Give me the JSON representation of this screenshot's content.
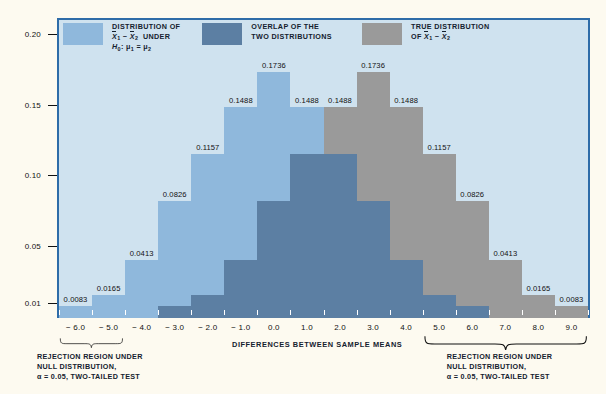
{
  "colors": {
    "page_background": "#fdfaf0",
    "plot_background": "#cfe2ef",
    "plot_border": "#2e6ca8",
    "null_distribution": "#8fb8dc",
    "overlap": "#5c7fa3",
    "true_distribution": "#9a9a9a",
    "text": "#14212e",
    "axis": "#111111",
    "xtick": "#ffffff"
  },
  "legend": {
    "items": [
      {
        "swatch_color": "#8fb8dc",
        "swatch_name": "null-distribution-swatch",
        "lines": [
          "DISTRIBUTION OF",
          "X̄1 − X̄2  UNDER",
          "H0: μ1 = μ2"
        ],
        "line1": "DISTRIBUTION OF",
        "line2_prefix": "X",
        "line2_sub1": "1",
        "line2_minus": " − ",
        "line2_sub2": "2",
        "line2_suffix": "UNDER",
        "line3_h": "H",
        "line3_hsub": "0",
        "line3_rest": ": μ",
        "line3_sub1": "1",
        "line3_eq": " = μ",
        "line3_sub2": "2"
      },
      {
        "swatch_color": "#5c7fa3",
        "swatch_name": "overlap-swatch",
        "line1": "OVERLAP OF THE",
        "line2": "TWO DISTRIBUTIONS"
      },
      {
        "swatch_color": "#9a9a9a",
        "swatch_name": "true-distribution-swatch",
        "line1": "TRUE DISTRIBUTION",
        "line2_prefix": "OF ",
        "line2_x": "X",
        "line2_sub1": "1",
        "line2_minus": " − ",
        "line2_sub2": "2"
      }
    ]
  },
  "axis_title": "DIFFERENCES BETWEEN SAMPLE MEANS",
  "captions": {
    "left": {
      "line1": "REJECTION REGION UNDER",
      "line2": "NULL DISTRIBUTION,",
      "line3": "α = 0.05, TWO-TAILED TEST"
    },
    "right": {
      "line1": "REJECTION REGION UNDER",
      "line2": "NULL DISTRIBUTION,",
      "line3": "α = 0.05, TWO-TAILED TEST"
    }
  },
  "chart_data": {
    "type": "bar",
    "title": "",
    "xlabel": "DIFFERENCES BETWEEN SAMPLE MEANS",
    "ylabel": "",
    "grid": false,
    "legend_position": "top-inside",
    "x": [
      -6.0,
      -5.0,
      -4.0,
      -3.0,
      -2.0,
      -1.0,
      0.0,
      1.0,
      2.0,
      3.0,
      4.0,
      5.0,
      6.0,
      7.0,
      8.0,
      9.0
    ],
    "xtick_labels": [
      "− 6.0",
      "− 5.0",
      "− 4.0",
      "− 3.0",
      "− 2.0",
      "− 1.0",
      "0.0",
      "1.0",
      "2.0",
      "3.0",
      "4.0",
      "5.0",
      "6.0",
      "7.0",
      "8.0",
      "9.0"
    ],
    "ytick_values": [
      0.01,
      0.05,
      0.1,
      0.15,
      0.2
    ],
    "ytick_labels": [
      "0.01",
      "0.05",
      "0.10",
      "0.15",
      "0.20"
    ],
    "ylim": [
      0,
      0.2105
    ],
    "xlim": [
      -6.5,
      9.5
    ],
    "bin_width": 1.0,
    "series": [
      {
        "name": "DISTRIBUTION OF X̄1 − X̄2 UNDER H0: μ1 = μ2",
        "color": "#8fb8dc",
        "center": 0.0,
        "x": [
          -6.0,
          -5.0,
          -4.0,
          -3.0,
          -2.0,
          -1.0,
          0.0,
          1.0,
          2.0,
          3.0,
          4.0,
          5.0,
          6.0
        ],
        "values": [
          0.0083,
          0.0165,
          0.0413,
          0.0826,
          0.1157,
          0.1488,
          0.1736,
          0.1488,
          0.1157,
          0.0826,
          0.0413,
          0.0165,
          0.0083
        ]
      },
      {
        "name": "TRUE DISTRIBUTION OF X̄1 − X̄2",
        "color": "#9a9a9a",
        "center": 3.0,
        "x": [
          -3.0,
          -2.0,
          -1.0,
          0.0,
          1.0,
          2.0,
          3.0,
          4.0,
          5.0,
          6.0,
          7.0,
          8.0,
          9.0
        ],
        "values": [
          0.0083,
          0.0165,
          0.0413,
          0.0826,
          0.1157,
          0.1488,
          0.1736,
          0.1488,
          0.1157,
          0.0826,
          0.0413,
          0.0165,
          0.0083
        ]
      }
    ],
    "labels_left": [
      {
        "x": -6.0,
        "text": "0.0083"
      },
      {
        "x": -5.0,
        "text": "0.0165"
      },
      {
        "x": -4.0,
        "text": "0.0413"
      },
      {
        "x": -3.0,
        "text": "0.0826"
      },
      {
        "x": -2.0,
        "text": "0.1157"
      },
      {
        "x": -1.0,
        "text": "0.1488"
      },
      {
        "x": 0.0,
        "text": "0.1736"
      },
      {
        "x": 1.0,
        "text": "0.1488"
      },
      {
        "x": 2.0,
        "text": "0.1488"
      }
    ],
    "labels_right": [
      {
        "x": 3.0,
        "text": "0.1736"
      },
      {
        "x": 4.0,
        "text": "0.1488"
      },
      {
        "x": 5.0,
        "text": "0.1157"
      },
      {
        "x": 6.0,
        "text": "0.0826"
      },
      {
        "x": 7.0,
        "text": "0.0413"
      },
      {
        "x": 8.0,
        "text": "0.0165"
      },
      {
        "x": 9.0,
        "text": "0.0083"
      }
    ],
    "rejection_regions": [
      {
        "side": "left",
        "from": -6.5,
        "to": -4.5,
        "alpha": 0.05,
        "tails": "two-tailed"
      },
      {
        "side": "right",
        "from": 4.5,
        "to": 9.5,
        "alpha": 0.05,
        "tails": "two-tailed"
      }
    ]
  }
}
